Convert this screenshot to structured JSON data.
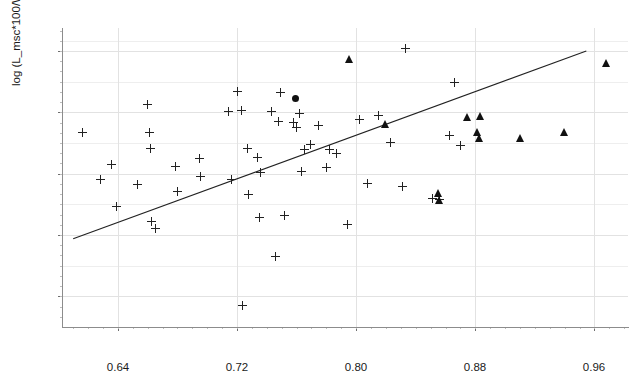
{
  "chart_data": {
    "type": "scatter",
    "title": "",
    "xlabel": "log L_valve",
    "ylabel": "log (L_msc*100/W_msc)",
    "xlim": [
      0.6025,
      0.9825
    ],
    "ylim": [
      1.74,
      2.325
    ],
    "xticks": [
      0.64,
      0.72,
      0.8,
      0.88,
      0.96
    ],
    "xticklabels": [
      "0.64",
      "0.72",
      "0.80",
      "0.88",
      "0.96"
    ],
    "yticks": [
      1.8,
      1.92,
      2.04,
      2.16,
      2.28
    ],
    "yticklabels": [
      "1.80",
      "1.92",
      "2.04",
      "2.16",
      "2.28"
    ],
    "grid": true,
    "grid_color": "#e2e2e2",
    "legend": "none",
    "marker_color": "#222222",
    "line_color": "#222222",
    "series": [
      {
        "name": "plus",
        "marker": "plus",
        "points": [
          [
            0.616,
            2.12
          ],
          [
            0.628,
            2.029
          ],
          [
            0.6355,
            2.059
          ],
          [
            0.639,
            1.976
          ],
          [
            0.653,
            2.019
          ],
          [
            0.66,
            2.175
          ],
          [
            0.661,
            2.12
          ],
          [
            0.662,
            2.089
          ],
          [
            0.6625,
            1.946
          ],
          [
            0.6655,
            1.933
          ],
          [
            0.679,
            2.054
          ],
          [
            0.68,
            2.005
          ],
          [
            0.6945,
            2.07
          ],
          [
            0.6955,
            2.035
          ],
          [
            0.7145,
            2.162
          ],
          [
            0.716,
            2.029
          ],
          [
            0.72,
            2.2
          ],
          [
            0.723,
            2.163
          ],
          [
            0.7235,
            1.783
          ],
          [
            0.727,
            2.089
          ],
          [
            0.728,
            2.0
          ],
          [
            0.734,
            2.072
          ],
          [
            0.735,
            1.954
          ],
          [
            0.736,
            2.042
          ],
          [
            0.743,
            2.161
          ],
          [
            0.7455,
            1.878
          ],
          [
            0.748,
            2.143
          ],
          [
            0.749,
            2.199
          ],
          [
            0.752,
            1.959
          ],
          [
            0.758,
            2.14
          ],
          [
            0.76,
            2.13
          ],
          [
            0.762,
            2.157
          ],
          [
            0.763,
            2.044
          ],
          [
            0.765,
            2.087
          ],
          [
            0.769,
            2.098
          ],
          [
            0.775,
            2.134
          ],
          [
            0.78,
            2.052
          ],
          [
            0.782,
            2.088
          ],
          [
            0.7865,
            2.08
          ],
          [
            0.794,
            1.94
          ],
          [
            0.802,
            2.147
          ],
          [
            0.8075,
            2.021
          ],
          [
            0.815,
            2.153
          ],
          [
            0.823,
            2.101
          ],
          [
            0.831,
            2.015
          ],
          [
            0.833,
            2.285
          ],
          [
            0.851,
            1.992
          ],
          [
            0.856,
            1.99
          ],
          [
            0.8625,
            2.115
          ],
          [
            0.866,
            2.219
          ],
          [
            0.87,
            2.096
          ]
        ]
      },
      {
        "name": "triangle",
        "marker": "triangle",
        "points": [
          [
            0.7955,
            2.264
          ],
          [
            0.8195,
            2.138
          ],
          [
            0.855,
            2.003
          ],
          [
            0.856,
            1.989
          ],
          [
            0.8745,
            2.15
          ],
          [
            0.8815,
            2.122
          ],
          [
            0.883,
            2.109
          ],
          [
            0.8835,
            2.152
          ],
          [
            0.91,
            2.109
          ],
          [
            0.9395,
            2.121
          ],
          [
            0.968,
            2.256
          ]
        ]
      },
      {
        "name": "filled-circle",
        "marker": "circle",
        "points": [
          [
            0.7595,
            2.188
          ]
        ]
      }
    ],
    "fit_line": {
      "type": "line",
      "x": [
        0.61,
        0.9545
      ],
      "y": [
        1.9125,
        2.28
      ]
    }
  }
}
